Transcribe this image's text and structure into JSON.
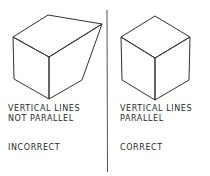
{
  "left_panel": {
    "caption_line1": "VERTICAL LINES",
    "caption_line2": "NOT PARALLEL",
    "verdict": "INCORRECT"
  },
  "right_panel": {
    "caption_line1": "VERTICAL LINES",
    "caption_line2": "PARALLEL",
    "verdict": "CORRECT"
  },
  "colors": {
    "line": "#333333",
    "text": "#2a2a2a",
    "divider": "#555555"
  }
}
